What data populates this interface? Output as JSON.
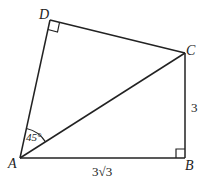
{
  "figure": {
    "points": {
      "A": {
        "label": "A"
      },
      "B": {
        "label": "B"
      },
      "C": {
        "label": "C"
      },
      "D": {
        "label": "D"
      }
    },
    "segments": [
      "AB",
      "BC",
      "CD",
      "DA",
      "AC"
    ],
    "measurements": {
      "AB": "3√3",
      "BC": "3",
      "angle_DAC": "45°"
    },
    "right_angles": [
      "B",
      "D"
    ],
    "colors": {
      "stroke": "#222222",
      "background": "#ffffff"
    }
  }
}
